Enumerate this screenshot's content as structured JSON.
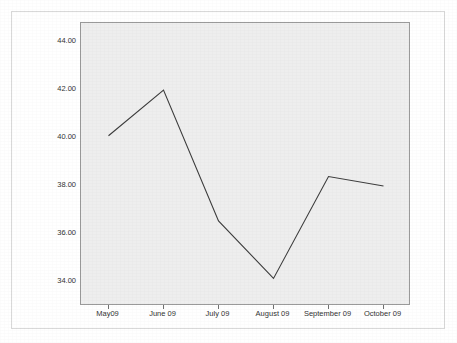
{
  "chart_data": {
    "type": "line",
    "title": "",
    "subtitle": "",
    "xlabel": "",
    "ylabel": "Perceived Caregiver Strain",
    "categories": [
      "May09",
      "June 09",
      "July 09",
      "August 09",
      "September 09",
      "October 09"
    ],
    "values": [
      40.1,
      42.0,
      36.55,
      34.15,
      38.4,
      38.0
    ],
    "series": [
      {
        "name": "Perceived Caregiver Strain",
        "values": [
          40.1,
          42.0,
          36.55,
          34.15,
          38.4,
          38.0
        ]
      }
    ],
    "ylim": [
      33.0,
      44.8
    ],
    "ytick_values": [
      34.0,
      36.0,
      38.0,
      40.0,
      42.0,
      44.0
    ],
    "ytick_labels": [
      "34.00",
      "36.00",
      "38.00",
      "40.00",
      "42.00",
      "44.00"
    ],
    "grid": false,
    "legend": "none",
    "line_color": "#3c3c3c",
    "panel_background": "#eeeeee",
    "panel_border_color": "#9a9a9a",
    "figure_background": "#ffffff",
    "axis_text_color": "#333333"
  }
}
